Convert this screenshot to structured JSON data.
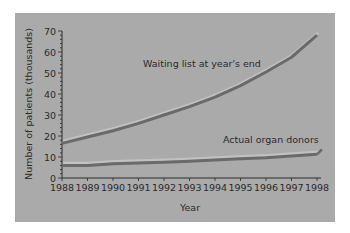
{
  "chart_data": {
    "type": "line",
    "title": "",
    "xlabel": "Year",
    "ylabel": "Number of patients (thousands)",
    "x": [
      1988,
      1989,
      1990,
      1991,
      1992,
      1993,
      1994,
      1995,
      1996,
      1997,
      1998
    ],
    "yticks": [
      0,
      10,
      20,
      30,
      40,
      50,
      60,
      70
    ],
    "ylim": [
      0,
      70
    ],
    "grid": false,
    "legend": "inline labels",
    "series": [
      {
        "name": "Waiting list at year's end",
        "values": [
          16.5,
          19.5,
          22.5,
          26,
          30,
          34,
          38.5,
          44,
          50.5,
          57.5,
          68
        ]
      },
      {
        "name": "Actual organ donors",
        "values": [
          6,
          6,
          6.8,
          7.2,
          7.5,
          8,
          8.6,
          9.2,
          9.6,
          10.5,
          11.3
        ]
      }
    ],
    "annotations": [
      "Waiting list at year's end",
      "Actual organ donors"
    ]
  },
  "colors": {
    "panel": "#aaaaaa",
    "line": "#6a6a6a",
    "highlight": "#c8c8c8",
    "text": "#2a2a2a"
  }
}
